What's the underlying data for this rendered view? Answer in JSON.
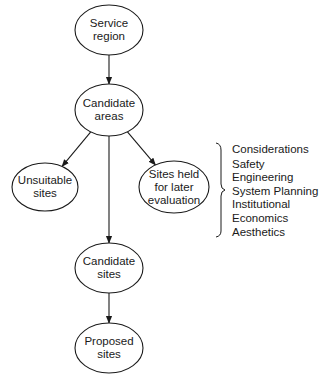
{
  "diagram": {
    "nodes": [
      {
        "id": "service-region",
        "lines": [
          "Service",
          "region"
        ],
        "cx": 109,
        "cy": 30,
        "rx": 34,
        "ry": 25
      },
      {
        "id": "candidate-areas",
        "lines": [
          "Candidate",
          "areas"
        ],
        "cx": 109,
        "cy": 110,
        "rx": 34,
        "ry": 26
      },
      {
        "id": "unsuitable-sites",
        "lines": [
          "Unsuitable",
          "sites"
        ],
        "cx": 45,
        "cy": 187,
        "rx": 33,
        "ry": 24
      },
      {
        "id": "sites-held",
        "lines": [
          "Sites held",
          "for later",
          "evaluation"
        ],
        "cx": 174,
        "cy": 187,
        "rx": 35,
        "ry": 26
      },
      {
        "id": "candidate-sites",
        "lines": [
          "Candidate",
          "sites"
        ],
        "cx": 109,
        "cy": 268,
        "rx": 34,
        "ry": 25
      },
      {
        "id": "proposed-sites",
        "lines": [
          "Proposed",
          "sites"
        ],
        "cx": 109,
        "cy": 348,
        "rx": 34,
        "ry": 25
      }
    ],
    "edges": [
      {
        "from": "service-region",
        "to": "candidate-areas"
      },
      {
        "from": "candidate-areas",
        "to": "unsuitable-sites"
      },
      {
        "from": "candidate-areas",
        "to": "sites-held"
      },
      {
        "from": "candidate-areas",
        "to": "candidate-sites"
      },
      {
        "from": "candidate-sites",
        "to": "proposed-sites"
      }
    ],
    "considerations": {
      "title": "Considerations",
      "items": [
        "Safety",
        "Engineering",
        "System Planning",
        "Institutional",
        "Economics",
        "Aesthetics"
      ]
    },
    "colors": {
      "stroke": "#1a1a1a",
      "background": "#ffffff"
    }
  }
}
